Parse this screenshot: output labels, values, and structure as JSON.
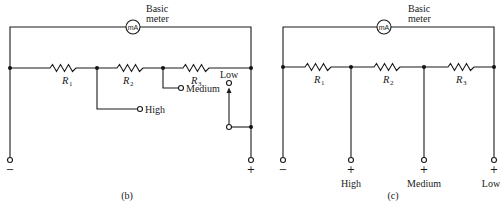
{
  "figure": {
    "type": "circuit-schematic"
  },
  "diagram_b": {
    "caption": "(b)",
    "meter": {
      "symbol": "mA",
      "label_line1": "Basic",
      "label_line2": "meter"
    },
    "resistors": [
      {
        "name": "R",
        "subscript": "1"
      },
      {
        "name": "R",
        "subscript": "2"
      },
      {
        "name": "R",
        "subscript": "3"
      }
    ],
    "taps": {
      "high": "High",
      "medium": "Medium",
      "low": "Low"
    },
    "terminals": {
      "negative": "−",
      "positive": "+"
    }
  },
  "diagram_c": {
    "caption": "(c)",
    "meter": {
      "symbol": "mA",
      "label_line1": "Basic",
      "label_line2": "meter"
    },
    "resistors": [
      {
        "name": "R",
        "subscript": "1"
      },
      {
        "name": "R",
        "subscript": "2"
      },
      {
        "name": "R",
        "subscript": "3"
      }
    ],
    "terminals": {
      "negative": "−",
      "high": {
        "sign": "+",
        "label": "High"
      },
      "medium": {
        "sign": "+",
        "label": "Medium"
      },
      "low": {
        "sign": "+",
        "label": "Low"
      }
    }
  },
  "colors": {
    "ink": "#1a1a1a",
    "background": "#ffffff"
  }
}
